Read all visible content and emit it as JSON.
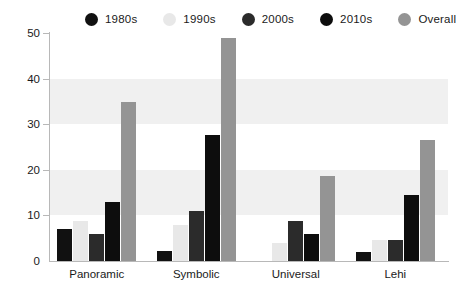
{
  "chart_data": {
    "type": "bar",
    "title": "",
    "subtitle": "",
    "xlabel": "",
    "ylabel": "",
    "categories": [
      "Panoramic",
      "Symbolic",
      "Universal",
      "Lehi"
    ],
    "series": [
      {
        "name": "1980s",
        "color": "#111111",
        "values": [
          7.0,
          2.1,
          0.0,
          2.0
        ]
      },
      {
        "name": "1990s",
        "color": "#e8e8e8",
        "values": [
          8.8,
          7.9,
          3.9,
          4.7
        ]
      },
      {
        "name": "2000s",
        "color": "#2b2b2b",
        "values": [
          5.9,
          10.9,
          8.7,
          4.7
        ]
      },
      {
        "name": "2010s",
        "color": "#0d0d0d",
        "values": [
          12.9,
          27.6,
          5.9,
          14.4
        ]
      },
      {
        "name": "Overall",
        "color": "#949494",
        "values": [
          34.8,
          49.0,
          18.7,
          26.5
        ]
      }
    ],
    "ylim": [
      0,
      50
    ],
    "yticks": [
      0,
      10,
      20,
      30,
      40,
      50
    ],
    "ytick_labels": [
      "0",
      "10",
      "20",
      "30",
      "40",
      "50"
    ],
    "grid": false,
    "bands": [
      [
        10,
        20
      ],
      [
        30,
        40
      ]
    ],
    "band_color": "#f0f0f0",
    "legend_position": "top",
    "axis_color": "#b8b8b8",
    "text_color": "#1a1a1a"
  }
}
